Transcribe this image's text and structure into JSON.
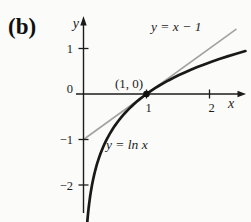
{
  "figure": {
    "panel_label": "(b)",
    "labels": {
      "y_axis": "y",
      "x_axis": "x",
      "origin": "0",
      "tangent_line": "y = x − 1",
      "curve": "y = ln x",
      "point": "(1, 0)"
    },
    "colors": {
      "background": "#fbfbf9",
      "curve": "#191919",
      "tangent_line": "#a3a3a3",
      "axis": "#1c1c1c",
      "text": "#1c1c1c"
    }
  },
  "chart_data": {
    "type": "line",
    "title": "",
    "xlabel": "x",
    "ylabel": "y",
    "xlim": [
      0,
      2.6
    ],
    "ylim": [
      -2.9,
      1.75
    ],
    "x_ticks": [
      1,
      2
    ],
    "y_ticks": [
      1,
      -1,
      -2
    ],
    "x_tick_labels": [
      "1",
      "2"
    ],
    "y_tick_labels": [
      "1",
      "−1",
      "−2"
    ],
    "grid": false,
    "legend": "inline-annotations",
    "series": [
      {
        "name": "y = ln x",
        "fn": "ln",
        "x_domain": [
          0.06,
          2.57
        ],
        "sample_points": [
          [
            0.1,
            -2.3
          ],
          [
            0.25,
            -1.39
          ],
          [
            0.5,
            -0.69
          ],
          [
            1,
            0
          ],
          [
            1.5,
            0.41
          ],
          [
            2,
            0.69
          ],
          [
            2.5,
            0.92
          ]
        ],
        "style": "solid-black-thick"
      },
      {
        "name": "y = x − 1",
        "fn": "linear",
        "slope": 1,
        "intercept": -1,
        "x_domain": [
          0,
          2.42
        ],
        "sample_points": [
          [
            0,
            -1
          ],
          [
            1,
            0
          ],
          [
            2,
            1
          ]
        ],
        "style": "solid-gray-thin"
      }
    ],
    "marked_point": {
      "x": 1,
      "y": 0,
      "label": "(1, 0)"
    }
  }
}
